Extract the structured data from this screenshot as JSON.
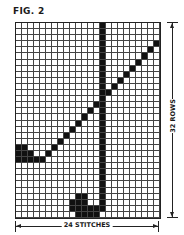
{
  "figure": {
    "title": "FIG. 2"
  },
  "chart": {
    "columns": 24,
    "rows": 32,
    "cell_width": 6,
    "cell_height": 6.1,
    "fill_color": "#111111",
    "grid_color": "#444444",
    "filled_cells": [
      [
        0,
        14
      ],
      [
        1,
        14
      ],
      [
        2,
        14
      ],
      [
        3,
        14
      ],
      [
        4,
        14
      ],
      [
        5,
        14
      ],
      [
        6,
        14
      ],
      [
        7,
        14
      ],
      [
        8,
        14
      ],
      [
        9,
        14
      ],
      [
        10,
        14
      ],
      [
        11,
        14
      ],
      [
        12,
        14
      ],
      [
        13,
        14
      ],
      [
        14,
        14
      ],
      [
        15,
        14
      ],
      [
        16,
        14
      ],
      [
        17,
        14
      ],
      [
        18,
        14
      ],
      [
        19,
        14
      ],
      [
        20,
        14
      ],
      [
        21,
        14
      ],
      [
        22,
        14
      ],
      [
        23,
        14
      ],
      [
        24,
        14
      ],
      [
        25,
        14
      ],
      [
        26,
        14
      ],
      [
        27,
        14
      ],
      [
        28,
        14
      ],
      [
        29,
        14
      ],
      [
        30,
        14
      ],
      [
        3,
        23
      ],
      [
        4,
        22
      ],
      [
        5,
        21
      ],
      [
        6,
        20
      ],
      [
        7,
        19
      ],
      [
        8,
        18
      ],
      [
        9,
        17
      ],
      [
        10,
        16
      ],
      [
        11,
        15
      ],
      [
        12,
        14
      ],
      [
        13,
        13
      ],
      [
        14,
        12
      ],
      [
        15,
        11
      ],
      [
        16,
        10
      ],
      [
        17,
        9
      ],
      [
        18,
        8
      ],
      [
        19,
        7
      ],
      [
        20,
        6
      ],
      [
        21,
        5
      ],
      [
        20,
        0
      ],
      [
        20,
        1
      ],
      [
        21,
        0
      ],
      [
        21,
        1
      ],
      [
        21,
        2
      ],
      [
        22,
        0
      ],
      [
        22,
        1
      ],
      [
        22,
        2
      ],
      [
        22,
        3
      ],
      [
        22,
        4
      ],
      [
        28,
        10
      ],
      [
        28,
        11
      ],
      [
        29,
        9
      ],
      [
        29,
        10
      ],
      [
        29,
        11
      ],
      [
        30,
        9
      ],
      [
        30,
        10
      ],
      [
        30,
        11
      ],
      [
        30,
        12
      ],
      [
        30,
        13
      ],
      [
        31,
        10
      ],
      [
        31,
        11
      ],
      [
        31,
        12
      ],
      [
        31,
        13
      ]
    ]
  },
  "dimensions": {
    "width_label": "24 STITCHES",
    "height_label": "32 ROWS"
  }
}
